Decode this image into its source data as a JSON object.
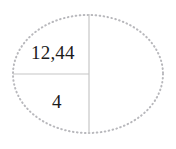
{
  "figure": {
    "type": "ellipse-partition-diagram",
    "background_color": "#ffffff",
    "width": 176,
    "height": 149,
    "outline": {
      "shape_name": "ellipse",
      "stroke_style": "dotted",
      "stroke_color": "#b8b8bc",
      "stroke_width": 2,
      "center_x": 88,
      "center_y": 74,
      "radius_x": 76,
      "radius_y": 60
    },
    "dividers": [
      {
        "name": "vertical-divider",
        "orientation": "vertical",
        "stroke_color": "#c6c6c6",
        "stroke_width": 1,
        "x1": 89,
        "y1": 14,
        "x2": 89,
        "y2": 134
      },
      {
        "name": "horizontal-divider",
        "orientation": "horizontal",
        "stroke_color": "#c6c6c6",
        "stroke_width": 1,
        "x1": 13,
        "y1": 74,
        "x2": 89,
        "y2": 74
      }
    ],
    "labels": [
      {
        "name": "upper-left-region-value",
        "text": "12,44",
        "region": "upper-left",
        "color": "#1b1b1b",
        "x": 31,
        "y": 43
      },
      {
        "name": "lower-left-region-value",
        "text": "4",
        "region": "lower-left",
        "color": "#1b1b1b",
        "x": 52,
        "y": 92
      }
    ]
  },
  "chart_data": {
    "type": "pie",
    "title": "",
    "subtitle": "",
    "xlabel": "",
    "ylabel": "",
    "legend": [],
    "grid": false,
    "shape": "ellipse",
    "categories": [
      "upper-left",
      "lower-left",
      "right"
    ],
    "labels": [
      "12,44",
      "4",
      ""
    ],
    "values": [
      12.44,
      4,
      null
    ],
    "slice_angles_deg": [
      90,
      90,
      180
    ],
    "label_positions": [
      {
        "region": "upper-left",
        "x": 31,
        "y": 43
      },
      {
        "region": "lower-left",
        "x": 52,
        "y": 92
      },
      {
        "region": "right",
        "x": null,
        "y": null
      }
    ]
  }
}
